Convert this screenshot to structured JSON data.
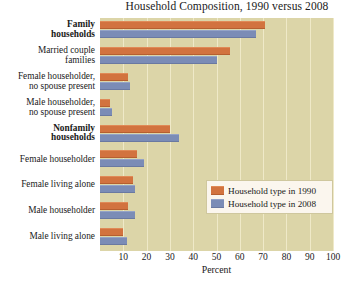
{
  "chart_data": {
    "type": "bar",
    "orientation": "horizontal",
    "title": "Household Composition, 1990 versus 2008",
    "xlabel": "Percent",
    "ylabel": "",
    "xlim": [
      0,
      100
    ],
    "xticks": [
      10,
      20,
      30,
      40,
      50,
      60,
      70,
      80,
      90,
      100
    ],
    "grid": true,
    "legend_position": "center-right",
    "categories": [
      "Family households",
      "Married couple families",
      "Female householder, no spouse present",
      "Male householder, no spouse present",
      "Nonfamily households",
      "Female householder",
      "Female living alone",
      "Male householder",
      "Male living alone"
    ],
    "category_labels": [
      {
        "line1": "Family",
        "line2": "households",
        "bold": true
      },
      {
        "line1": "Married couple",
        "line2": "families",
        "bold": false
      },
      {
        "line1": "Female householder,",
        "line2": "no spouse present",
        "bold": false
      },
      {
        "line1": "Male householder,",
        "line2": "no spouse present",
        "bold": false
      },
      {
        "line1": "Nonfamily",
        "line2": "households",
        "bold": true
      },
      {
        "line1": "Female householder",
        "line2": "",
        "bold": false
      },
      {
        "line1": "Female living alone",
        "line2": "",
        "bold": false
      },
      {
        "line1": "Male householder",
        "line2": "",
        "bold": false
      },
      {
        "line1": "Male living alone",
        "line2": "",
        "bold": false
      }
    ],
    "series": [
      {
        "name": "Household type in 1990",
        "color": "#d2733f",
        "values": [
          71,
          56,
          12,
          4.5,
          30,
          16,
          14,
          12,
          10
        ]
      },
      {
        "name": "Household type in 2008",
        "color": "#7b8cb6",
        "values": [
          67,
          50,
          13,
          5,
          34,
          19,
          15,
          15,
          11.5
        ]
      }
    ]
  },
  "legend": {
    "items": [
      {
        "label": "Household type in 1990",
        "color": "#d2733f"
      },
      {
        "label": "Household type in 2008",
        "color": "#7b8cb6"
      }
    ]
  },
  "colors": {
    "plot_background": "#dcd5a8",
    "gridline": "#efe9c8",
    "legend_background": "#fbf6ee",
    "legend_border": "#cfc79e",
    "text": "#1a1a1a"
  }
}
